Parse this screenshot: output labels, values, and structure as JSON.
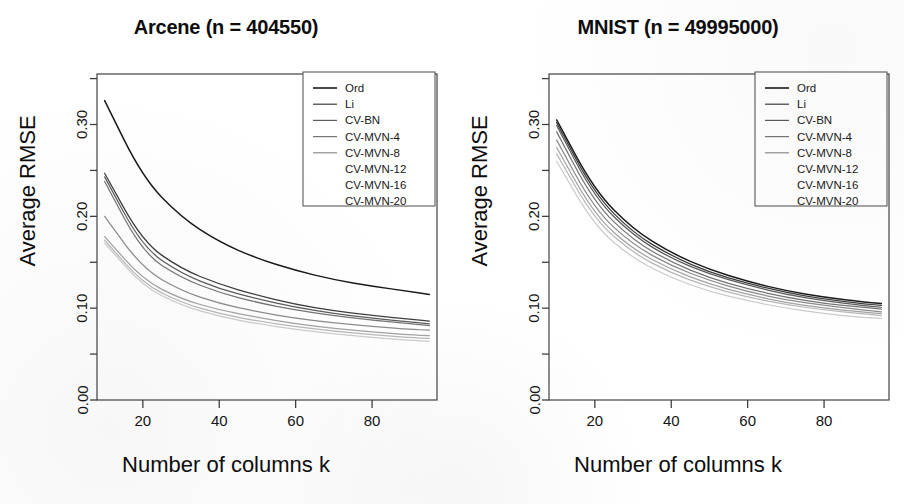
{
  "figure": {
    "axis_labels": {
      "y": "Average RMSE",
      "x": "Number of columns k"
    },
    "series_names": [
      "Ord",
      "Li",
      "CV-BN",
      "CV-MVN-4",
      "CV-MVN-8",
      "CV-MVN-12",
      "CV-MVN-16",
      "CV-MVN-20"
    ],
    "series_colors": [
      "#1a1a1a",
      "#3d3d3d",
      "#5c5c5c",
      "#757575",
      "#8c8c8c",
      "#a3a3a3",
      "#b8b8b8",
      "#cccccc"
    ]
  },
  "chart_data": [
    {
      "type": "line",
      "panel": "left",
      "title": "Arcene (n = 404550)",
      "xlabel": "Number of columns k",
      "ylabel": "Average RMSE",
      "xlim": [
        8,
        97
      ],
      "ylim": [
        0.0,
        0.355
      ],
      "xticks": [
        20,
        40,
        60,
        80
      ],
      "xtick_labels": [
        "20",
        "40",
        "60",
        "80"
      ],
      "yticks": [
        0.0,
        0.05,
        0.1,
        0.15,
        0.2,
        0.25,
        0.3,
        0.35
      ],
      "ytick_labels": [
        "0.00",
        "",
        "0.10",
        "",
        "0.20",
        "",
        "0.30",
        ""
      ],
      "grid": false,
      "legend_position": "top-right",
      "x": [
        10,
        20,
        30,
        40,
        50,
        60,
        70,
        80,
        90,
        95
      ],
      "series": [
        {
          "name": "Ord",
          "color": "#1a1a1a",
          "values": [
            0.326,
            0.242,
            0.199,
            0.172,
            0.154,
            0.141,
            0.131,
            0.124,
            0.118,
            0.115
          ]
        },
        {
          "name": "Li",
          "color": "#3d3d3d",
          "values": [
            0.247,
            0.172,
            0.143,
            0.126,
            0.114,
            0.104,
            0.097,
            0.092,
            0.088,
            0.086
          ]
        },
        {
          "name": "CV-BN",
          "color": "#5c5c5c",
          "values": [
            0.243,
            0.166,
            0.138,
            0.121,
            0.11,
            0.101,
            0.094,
            0.089,
            0.085,
            0.083
          ]
        },
        {
          "name": "CV-MVN-4",
          "color": "#757575",
          "values": [
            0.238,
            0.16,
            0.133,
            0.117,
            0.106,
            0.098,
            0.092,
            0.087,
            0.083,
            0.081
          ]
        },
        {
          "name": "CV-MVN-8",
          "color": "#8c8c8c",
          "values": [
            0.2,
            0.143,
            0.119,
            0.105,
            0.096,
            0.089,
            0.084,
            0.08,
            0.077,
            0.076
          ]
        },
        {
          "name": "CV-MVN-12",
          "color": "#a3a3a3",
          "values": [
            0.178,
            0.131,
            0.11,
            0.098,
            0.09,
            0.083,
            0.078,
            0.074,
            0.071,
            0.07
          ]
        },
        {
          "name": "CV-MVN-16",
          "color": "#b8b8b8",
          "values": [
            0.174,
            0.127,
            0.106,
            0.094,
            0.086,
            0.08,
            0.075,
            0.071,
            0.068,
            0.067
          ]
        },
        {
          "name": "CV-MVN-20",
          "color": "#cccccc",
          "values": [
            0.171,
            0.124,
            0.103,
            0.091,
            0.083,
            0.077,
            0.072,
            0.068,
            0.065,
            0.064
          ]
        }
      ]
    },
    {
      "type": "line",
      "panel": "right",
      "title": "MNIST (n = 49995000)",
      "xlabel": "Number of columns k",
      "ylabel": "Average RMSE",
      "xlim": [
        8,
        97
      ],
      "ylim": [
        0.0,
        0.355
      ],
      "xticks": [
        20,
        40,
        60,
        80
      ],
      "xtick_labels": [
        "20",
        "40",
        "60",
        "80"
      ],
      "yticks": [
        0.0,
        0.05,
        0.1,
        0.15,
        0.2,
        0.25,
        0.3,
        0.35
      ],
      "ytick_labels": [
        "0.00",
        "",
        "0.10",
        "",
        "0.20",
        "",
        "0.30",
        ""
      ],
      "grid": false,
      "legend_position": "top-right",
      "x": [
        10,
        20,
        30,
        40,
        50,
        60,
        70,
        80,
        90,
        95
      ],
      "series": [
        {
          "name": "Ord",
          "color": "#1a1a1a",
          "values": [
            0.305,
            0.228,
            0.186,
            0.16,
            0.142,
            0.129,
            0.119,
            0.112,
            0.107,
            0.105
          ]
        },
        {
          "name": "Li",
          "color": "#3d3d3d",
          "values": [
            0.302,
            0.224,
            0.182,
            0.157,
            0.139,
            0.127,
            0.117,
            0.11,
            0.105,
            0.103
          ]
        },
        {
          "name": "CV-BN",
          "color": "#5c5c5c",
          "values": [
            0.299,
            0.22,
            0.179,
            0.154,
            0.137,
            0.125,
            0.115,
            0.108,
            0.103,
            0.101
          ]
        },
        {
          "name": "CV-MVN-4",
          "color": "#757575",
          "values": [
            0.292,
            0.214,
            0.174,
            0.15,
            0.133,
            0.121,
            0.112,
            0.105,
            0.101,
            0.099
          ]
        },
        {
          "name": "CV-MVN-8",
          "color": "#8c8c8c",
          "values": [
            0.283,
            0.207,
            0.169,
            0.146,
            0.13,
            0.118,
            0.109,
            0.103,
            0.098,
            0.096
          ]
        },
        {
          "name": "CV-MVN-12",
          "color": "#a3a3a3",
          "values": [
            0.275,
            0.201,
            0.164,
            0.142,
            0.126,
            0.115,
            0.106,
            0.1,
            0.096,
            0.094
          ]
        },
        {
          "name": "CV-MVN-16",
          "color": "#b8b8b8",
          "values": [
            0.268,
            0.196,
            0.16,
            0.138,
            0.123,
            0.112,
            0.104,
            0.098,
            0.094,
            0.092
          ]
        },
        {
          "name": "CV-MVN-20",
          "color": "#cccccc",
          "values": [
            0.26,
            0.189,
            0.154,
            0.133,
            0.118,
            0.108,
            0.1,
            0.094,
            0.09,
            0.089
          ]
        }
      ]
    }
  ]
}
